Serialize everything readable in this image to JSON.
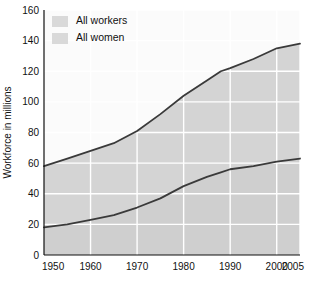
{
  "chart_data": {
    "type": "area",
    "title": "",
    "xlabel": "",
    "ylabel": "Workforce in millions",
    "xlim": [
      1950,
      2005
    ],
    "ylim": [
      0,
      160
    ],
    "ytick_step": 20,
    "grid": true,
    "legend_position": "top-left",
    "yticks": [
      "0",
      "20",
      "40",
      "60",
      "80",
      "100",
      "120",
      "140",
      "160"
    ],
    "xticks": [
      "1950",
      "1960",
      "1970",
      "1980",
      "1990",
      "2000",
      "2005"
    ],
    "legend": [
      {
        "label": "All workers",
        "swatch_color": "#d9d9d9"
      },
      {
        "label": "All women",
        "swatch_color": "#d9d9d9"
      }
    ],
    "series": [
      {
        "name": "All workers",
        "line_color": "#3a3a3a",
        "fill_color": "#d4d4d4",
        "x": [
          1950,
          1955,
          1960,
          1965,
          1970,
          1975,
          1980,
          1985,
          1988,
          1990,
          1995,
          2000,
          2005
        ],
        "values": [
          58,
          63,
          68,
          73,
          81,
          92,
          104,
          114,
          120,
          122,
          128,
          135,
          138
        ]
      },
      {
        "name": "All women",
        "line_color": "#3a3a3a",
        "fill_color": "#cfcfcf",
        "x": [
          1950,
          1955,
          1960,
          1965,
          1970,
          1975,
          1980,
          1985,
          1988,
          1990,
          1995,
          2000,
          2005
        ],
        "values": [
          18,
          20,
          23,
          26,
          31,
          37,
          45,
          51,
          54,
          56,
          58,
          61,
          63
        ]
      }
    ]
  }
}
